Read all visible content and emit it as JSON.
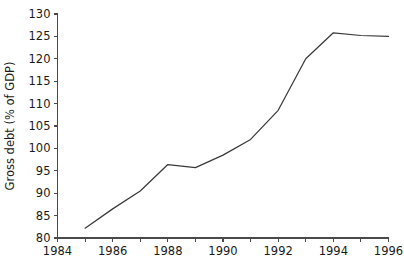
{
  "chart_data": {
    "type": "line",
    "title": "",
    "subtitle": "",
    "xlabel": "",
    "ylabel": "Gross debt (% of GDP)",
    "x": [
      1985,
      1986,
      1987,
      1988,
      1989,
      1990,
      1991,
      1992,
      1993,
      1994,
      1995,
      1996
    ],
    "values": [
      82.2,
      86.5,
      90.5,
      96.4,
      95.7,
      98.5,
      102.0,
      108.5,
      120.0,
      125.8,
      125.2,
      125.0
    ],
    "series": [
      {
        "name": "Gross debt",
        "values": [
          82.2,
          86.5,
          90.5,
          96.4,
          95.7,
          98.5,
          102.0,
          108.5,
          120.0,
          125.8,
          125.2,
          125.0
        ]
      }
    ],
    "xlim": [
      1984,
      1996
    ],
    "ylim": [
      80,
      130
    ],
    "xticks": [
      1984,
      1985,
      1986,
      1987,
      1988,
      1989,
      1990,
      1991,
      1992,
      1993,
      1994,
      1995,
      1996
    ],
    "xtick_labels": [
      "1984",
      "",
      "1986",
      "",
      "1988",
      "",
      "1990",
      "",
      "1992",
      "",
      "1994",
      "",
      "1996"
    ],
    "yticks": [
      80,
      85,
      90,
      95,
      100,
      105,
      110,
      115,
      120,
      125,
      130
    ],
    "ytick_labels": [
      "80",
      "85",
      "90",
      "95",
      "100",
      "105",
      "110",
      "115",
      "120",
      "125",
      "130"
    ],
    "grid": false,
    "legend": false,
    "legend_position": "none",
    "line_color": "#3a3a3a",
    "axis_color": "#4a4a4a",
    "background_color": "#ffffff",
    "annotations": []
  }
}
